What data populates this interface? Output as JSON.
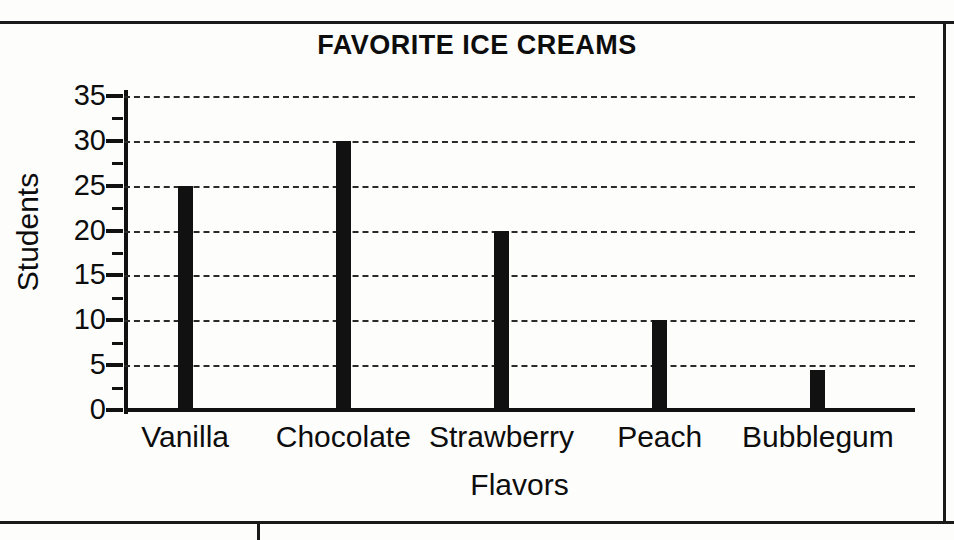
{
  "page": {
    "background_color": "#fdfdfc",
    "ink_color": "#111111"
  },
  "chart_data": {
    "type": "bar",
    "title": "FAVORITE ICE CREAMS",
    "xlabel": "Flavors",
    "ylabel": "Students",
    "categories": [
      "Vanilla",
      "Chocolate",
      "Strawberry",
      "Peach",
      "Bubblegum"
    ],
    "values": [
      25,
      30,
      20,
      10,
      4.5
    ],
    "ylim": [
      0,
      35
    ],
    "ytick_labels": [
      "35",
      "30",
      "25",
      "20",
      "15",
      "10",
      "5",
      "0"
    ],
    "ytick_values": [
      35,
      30,
      25,
      20,
      15,
      10,
      5,
      0
    ],
    "yminor_tick_values": [
      32.5,
      27.5,
      22.5,
      17.5,
      12.5,
      7.5,
      2.5
    ],
    "ytick_step": 5,
    "grid": "horizontal-dashed",
    "grid_color": "#2b2b2b",
    "bar_color": "#111111",
    "legend": "none",
    "legend_position": "none",
    "annotations": []
  }
}
